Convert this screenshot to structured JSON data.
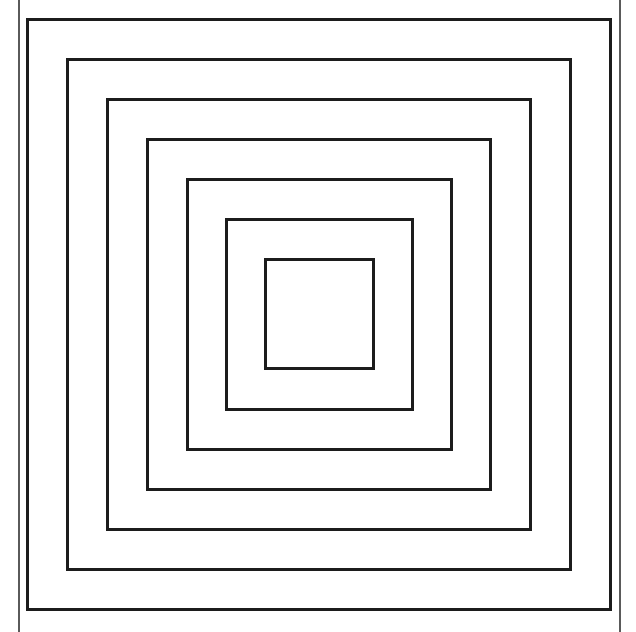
{
  "figure": {
    "width": 636,
    "height": 632,
    "background": "#ffffff",
    "stroke_color": "#1c1c1c",
    "stroke_width": 3,
    "border_lines": {
      "color": "#5a5a5a",
      "left_x": 18,
      "right_x": 619
    },
    "squares": [
      {
        "left": 26,
        "top": 18,
        "right": 612,
        "bottom": 611
      },
      {
        "left": 66,
        "top": 58,
        "right": 572,
        "bottom": 571
      },
      {
        "left": 106,
        "top": 98,
        "right": 532,
        "bottom": 531
      },
      {
        "left": 146,
        "top": 138,
        "right": 492,
        "bottom": 491
      },
      {
        "left": 186,
        "top": 178,
        "right": 453,
        "bottom": 451
      },
      {
        "left": 225,
        "top": 218,
        "right": 414,
        "bottom": 411
      },
      {
        "left": 264,
        "top": 258,
        "right": 375,
        "bottom": 370
      }
    ]
  }
}
